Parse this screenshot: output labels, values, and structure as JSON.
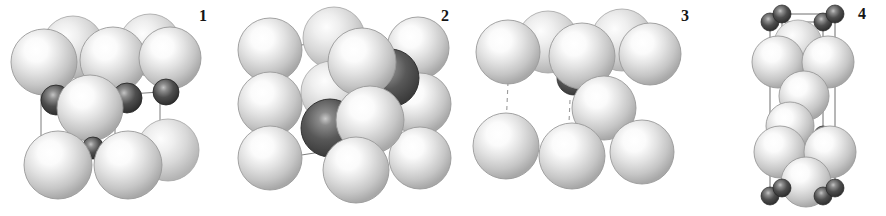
{
  "figure": {
    "kind": "scientific-figure",
    "width": 886,
    "height": 216,
    "background_color": "#ffffff",
    "atom_species": [
      {
        "name": "metal-atom",
        "appearance": "large light grey sphere with specular highlight",
        "base_color": "#c9c9c9",
        "highlight_color": "#ffffff",
        "edge_color": "#9a9a9a",
        "radius_px": 30
      },
      {
        "name": "interstitial-atom",
        "appearance": "small dark grey sphere with specular highlight",
        "base_color": "#4a4a4a",
        "highlight_color": "#bdbdbd",
        "edge_color": "#2c2c2c",
        "radius_px": 13
      }
    ],
    "bond_style": {
      "solid_color": "#7d7d7d",
      "dashed_color": "#9b9b9b",
      "width_px": 1
    },
    "panels": [
      {
        "id": "panel-1",
        "label": "1",
        "label_x": 199,
        "label_y": 8,
        "cell_line_style": "solid",
        "metal_count": 9,
        "interstitial_count": 4
      },
      {
        "id": "panel-2",
        "label": "2",
        "label_x": 441,
        "label_y": 8,
        "cell_line_style": "solid",
        "metal_count": 11,
        "interstitial_count": 2
      },
      {
        "id": "panel-3",
        "label": "3",
        "label_x": 681,
        "label_y": 8,
        "cell_line_style": "dashed",
        "metal_count": 9,
        "interstitial_count": 1
      },
      {
        "id": "panel-4",
        "label": "4",
        "label_x": 858,
        "label_y": 6,
        "cell_line_style": "solid",
        "metal_count": 10,
        "interstitial_count": 9
      }
    ]
  }
}
